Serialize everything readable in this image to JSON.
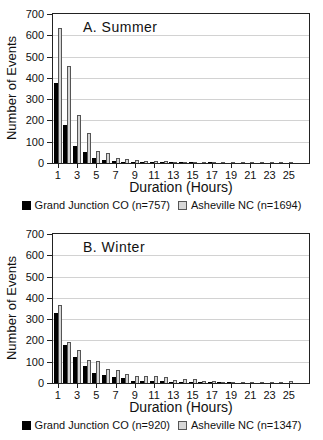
{
  "figure": {
    "background": "#ffffff",
    "text_color": "#1a1a1a",
    "gridline_color": "#d2d2d2",
    "axis_color": "#222222"
  },
  "chart_data": [
    {
      "id": "summer",
      "type": "bar",
      "title": "A. Summer",
      "xlabel": "Duration (Hours)",
      "ylabel": "Number of Events",
      "ylim": [
        0,
        700
      ],
      "yticks": [
        0,
        100,
        200,
        300,
        400,
        500,
        600,
        700
      ],
      "xticks": [
        1,
        3,
        5,
        7,
        9,
        11,
        13,
        15,
        17,
        19,
        21,
        23,
        25
      ],
      "grid": true,
      "legend_position": "bottom",
      "categories": [
        1,
        2,
        3,
        4,
        5,
        6,
        7,
        8,
        9,
        10,
        11,
        12,
        13,
        14,
        15,
        16,
        17,
        18,
        19,
        20,
        21,
        22,
        23,
        24,
        25
      ],
      "series": [
        {
          "name": "Grand Junction CO (n=757)",
          "color": "#000000",
          "values": [
            375,
            180,
            80,
            52,
            25,
            15,
            8,
            5,
            3,
            2,
            2,
            1,
            1,
            1,
            1,
            0,
            1,
            0,
            0,
            0,
            0,
            0,
            0,
            0,
            0
          ]
        },
        {
          "name": "Asheville NC (n=1694)",
          "color": "#d6d6d6",
          "border_color": "#555555",
          "values": [
            635,
            455,
            225,
            140,
            55,
            45,
            25,
            18,
            15,
            10,
            8,
            8,
            6,
            5,
            5,
            5,
            5,
            4,
            3,
            3,
            2,
            3,
            2,
            3,
            3
          ]
        }
      ]
    },
    {
      "id": "winter",
      "type": "bar",
      "title": "B. Winter",
      "xlabel": "Duration (Hours)",
      "ylabel": "Number of Events",
      "ylim": [
        0,
        700
      ],
      "yticks": [
        0,
        100,
        200,
        300,
        400,
        500,
        600,
        700
      ],
      "xticks": [
        1,
        3,
        5,
        7,
        9,
        11,
        13,
        15,
        17,
        19,
        21,
        23,
        25
      ],
      "grid": true,
      "legend_position": "bottom",
      "categories": [
        1,
        2,
        3,
        4,
        5,
        6,
        7,
        8,
        9,
        10,
        11,
        12,
        13,
        14,
        15,
        16,
        17,
        18,
        19,
        20,
        21,
        22,
        23,
        24,
        25
      ],
      "series": [
        {
          "name": "Grand Junction CO (n=920)",
          "color": "#000000",
          "values": [
            330,
            180,
            122,
            78,
            45,
            38,
            28,
            22,
            10,
            10,
            9,
            8,
            3,
            2,
            2,
            2,
            1,
            1,
            1,
            0,
            0,
            0,
            0,
            0,
            0
          ]
        },
        {
          "name": "Asheville NC (n=1347)",
          "color": "#d6d6d6",
          "border_color": "#555555",
          "values": [
            368,
            195,
            155,
            107,
            105,
            65,
            60,
            42,
            33,
            33,
            35,
            26,
            15,
            18,
            18,
            10,
            8,
            5,
            5,
            4,
            5,
            5,
            4,
            3,
            8
          ]
        }
      ]
    }
  ]
}
